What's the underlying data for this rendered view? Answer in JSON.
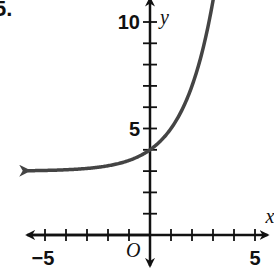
{
  "problem_number": "5.",
  "chart_data": {
    "type": "line",
    "title": "",
    "xlabel": "x",
    "ylabel": "y",
    "origin_label": "O",
    "xlim": [
      -6,
      5.5
    ],
    "ylim": [
      -1,
      12
    ],
    "x_tick_labels": [
      {
        "value": -5,
        "label": "−5"
      },
      {
        "value": 5,
        "label": "5"
      }
    ],
    "y_tick_labels": [
      {
        "value": 5,
        "label": "5"
      },
      {
        "value": 10,
        "label": "10"
      }
    ],
    "x_ticks": [
      -5,
      -4,
      -3,
      -2,
      -1,
      1,
      2,
      3,
      4,
      5
    ],
    "y_ticks": [
      1,
      2,
      3,
      4,
      5,
      6,
      7,
      8,
      9,
      10
    ],
    "grid": false,
    "series": [
      {
        "name": "y = 2^x + 3",
        "x": [
          -5.8,
          -5,
          -4,
          -3,
          -2,
          -1,
          0,
          1,
          2,
          3,
          3.2
        ],
        "y": [
          3.02,
          3.03,
          3.06,
          3.13,
          3.25,
          3.5,
          4,
          5,
          7,
          11,
          12.2
        ],
        "color": "#444444",
        "arrows": "both"
      }
    ],
    "y_intercept": 4,
    "horizontal_asymptote": 3
  }
}
